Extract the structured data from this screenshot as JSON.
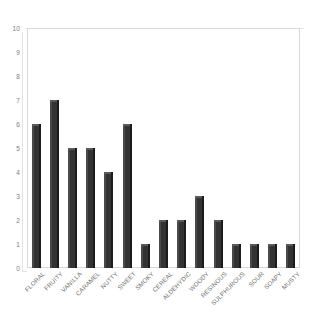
{
  "chart_data": {
    "type": "bar",
    "title": "",
    "subtitle": "",
    "xlabel": "",
    "ylabel": "",
    "ylim": [
      0,
      10
    ],
    "ytick_step": 1,
    "yticks": [
      10,
      9,
      8,
      7,
      6,
      5,
      4,
      3,
      2,
      1,
      0
    ],
    "grid": false,
    "legend": false,
    "legend_position": "none",
    "orientation": "vertical",
    "bar_color": "#333333",
    "bar_edge_light": "#4a4a4a",
    "bar_edge_dark": "#1c1c1c",
    "frame_color": "#d8d8d8",
    "tick_label_color": "#7d7d7d",
    "xtick_rotation_deg": -45,
    "categories": [
      "FLORAL",
      "FRUITY",
      "VANILLA",
      "CARAMEL",
      "NUTTY",
      "SWEET",
      "SMOKY",
      "CEREAL",
      "ALDEHYDIC",
      "WOODY",
      "RESINOUS",
      "SULPHUROUS",
      "SOUR",
      "SOAPY",
      "MUSTY"
    ],
    "values": [
      6,
      7,
      5,
      5,
      4,
      6,
      1,
      2,
      2,
      3,
      2,
      1,
      1,
      1,
      1
    ]
  }
}
